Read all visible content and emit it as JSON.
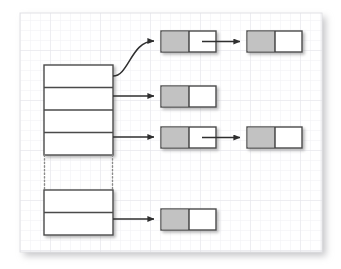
{
  "diagram": {
    "type": "linked-list-bucket-array",
    "canvas": {
      "x": 20,
      "y": 13,
      "width": 302,
      "height": 239,
      "background_color": "#ffffff",
      "border_color": "#e3e3e6",
      "grid_minor_color": "#f2f2f4",
      "grid_major_color": "#e6e6ea",
      "grid_minor_spacing": 10,
      "grid_major_spacing": 50,
      "shadow_color": "#c9c9cc"
    },
    "colors": {
      "stroke": "#4a4a4a",
      "node_data_fill": "#c2c2c2",
      "node_next_fill": "#ffffff",
      "box_fill": "#ffffff",
      "arrow": "#2f2f2f",
      "shadow": "#9a9a9a",
      "dotted": "#8a8a8a"
    },
    "bucket_array": {
      "label": "bucket-array",
      "x": 44,
      "width": 69,
      "upper_block": {
        "label": "upper-bucket-block",
        "y": 65,
        "height": 90,
        "rows": [
          {
            "name": "bucket-row-1",
            "y": 65,
            "height": 22.5,
            "has_chain": true
          },
          {
            "name": "bucket-row-2",
            "y": 87.5,
            "height": 22.5,
            "has_chain": true
          },
          {
            "name": "bucket-row-3",
            "y": 110,
            "height": 22.5,
            "has_chain": false
          },
          {
            "name": "bucket-row-4",
            "y": 132.5,
            "height": 22.5,
            "has_chain": true
          }
        ]
      },
      "continuation": {
        "label": "bucket-continuation-ellipsis",
        "y_top": 155,
        "y_bottom": 190,
        "style": "dotted"
      },
      "lower_block": {
        "label": "lower-bucket-block",
        "y": 190,
        "height": 45,
        "rows": [
          {
            "name": "bucket-row-n1",
            "y": 190,
            "height": 22.5,
            "has_chain": false
          },
          {
            "name": "bucket-row-n2",
            "y": 212.5,
            "height": 22.5,
            "has_chain": true
          }
        ]
      }
    },
    "node_geometry": {
      "width": 55,
      "height": 21,
      "data_cell_width": 28,
      "next_cell_width": 27,
      "column_1_x": 161,
      "column_2_x": 247
    },
    "chains": [
      {
        "name": "chain-bucket-1",
        "source_row": "bucket-row-1",
        "source_x": 113,
        "source_y": 76,
        "connector": "curve",
        "curve_end_x": 161,
        "curve_end_y": 41,
        "nodes": [
          {
            "name": "chain-1-node-1",
            "x": 161,
            "y": 31,
            "has_next": true
          },
          {
            "name": "chain-1-node-2",
            "x": 247,
            "y": 31,
            "has_next": false
          }
        ]
      },
      {
        "name": "chain-bucket-2",
        "source_row": "bucket-row-2",
        "source_x": 113,
        "source_y": 96,
        "connector": "straight",
        "nodes": [
          {
            "name": "chain-2-node-1",
            "x": 161,
            "y": 86,
            "has_next": false
          }
        ]
      },
      {
        "name": "chain-bucket-4",
        "source_row": "bucket-row-4",
        "source_x": 113,
        "source_y": 137,
        "connector": "straight",
        "nodes": [
          {
            "name": "chain-4-node-1",
            "x": 161,
            "y": 127,
            "has_next": true
          },
          {
            "name": "chain-4-node-2",
            "x": 247,
            "y": 127,
            "has_next": false
          }
        ]
      },
      {
        "name": "chain-bucket-n2",
        "source_row": "bucket-row-n2",
        "source_x": 113,
        "source_y": 219,
        "connector": "straight",
        "nodes": [
          {
            "name": "chain-n2-node-1",
            "x": 161,
            "y": 209,
            "has_next": false
          }
        ]
      }
    ]
  }
}
